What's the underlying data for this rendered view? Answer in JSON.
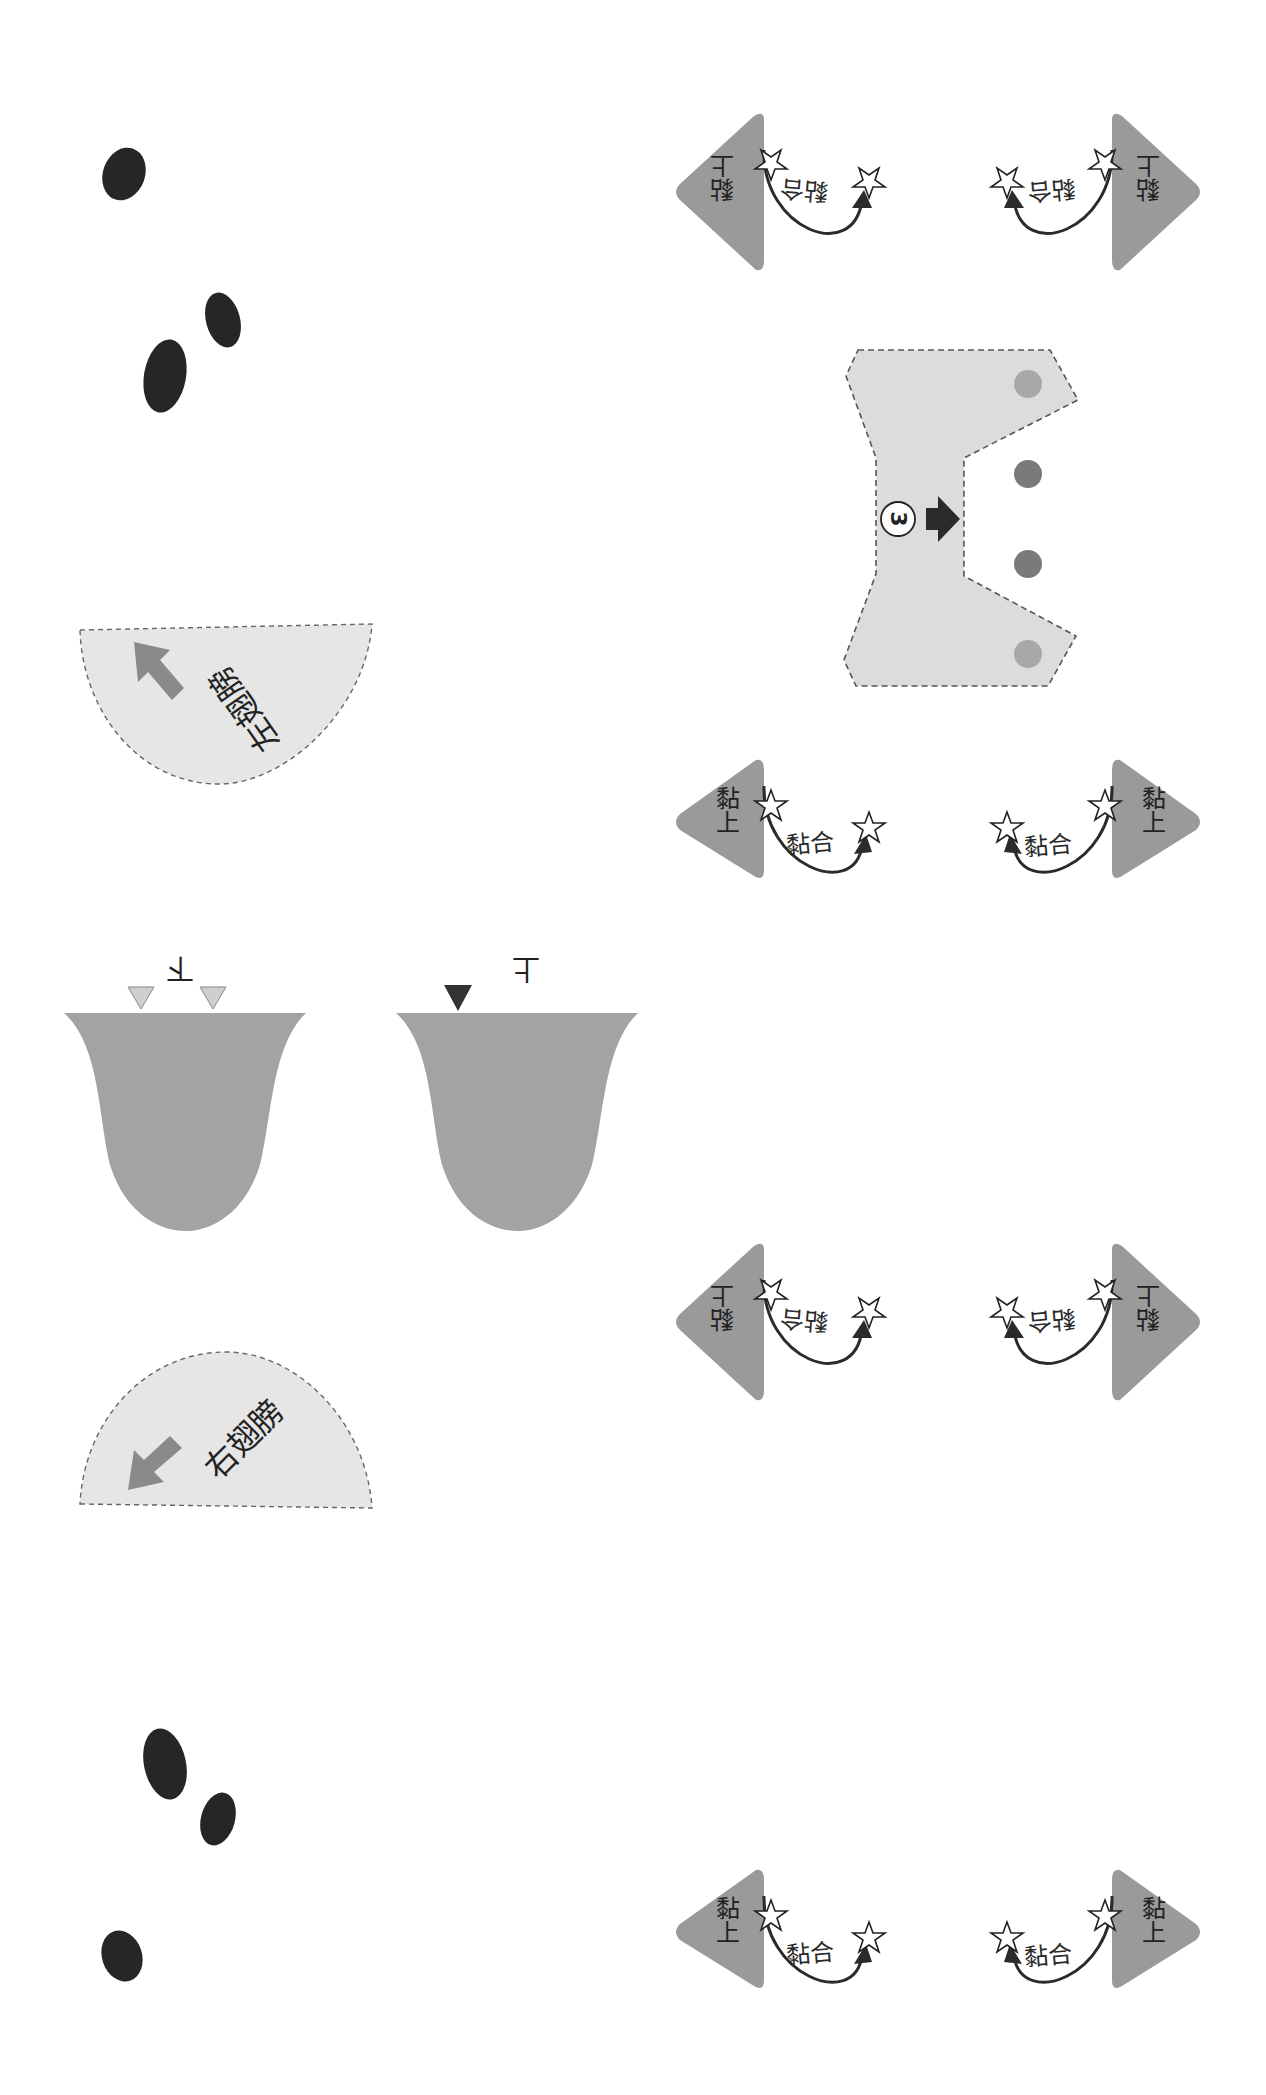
{
  "colors": {
    "tab_gray": "#9a9a9a",
    "panel_fill": "#dcdcdc",
    "wing_fill": "#e6e6e6",
    "tongue_fill": "#a3a3a3",
    "blob": "#262626",
    "arrow_dark": "#2b2b2b",
    "dot_light": "#a8a8a8",
    "dot_dark": "#7a7a7a",
    "wing_arrow": "#8a8a8a",
    "marker_light": "#cfcfcf",
    "marker_dark": "#333333"
  },
  "glue_groups": [
    {
      "id": "top",
      "flipped": true,
      "left": {
        "tab_label": "黏上",
        "arc_label": "黏合"
      },
      "right": {
        "tab_label": "黏上",
        "arc_label": "黏合"
      }
    },
    {
      "id": "upper-middle",
      "flipped": false,
      "left": {
        "tab_label": "黏上",
        "arc_label": "黏合"
      },
      "right": {
        "tab_label": "黏上",
        "arc_label": "黏合"
      }
    },
    {
      "id": "lower-middle",
      "flipped": true,
      "left": {
        "tab_label": "黏上",
        "arc_label": "黏合"
      },
      "right": {
        "tab_label": "黏上",
        "arc_label": "黏合"
      }
    },
    {
      "id": "bottom",
      "flipped": false,
      "left": {
        "tab_label": "黏上",
        "arc_label": "黏合"
      },
      "right": {
        "tab_label": "黏上",
        "arc_label": "黏合"
      }
    }
  ],
  "center_panel": {
    "step_number": "3",
    "dots": 4
  },
  "wings": {
    "left": {
      "label": "左翅膀"
    },
    "right": {
      "label": "右翅膀"
    }
  },
  "tongues": {
    "left": {
      "label": "下",
      "markers": 2
    },
    "right": {
      "label": "上",
      "markers": 1
    }
  },
  "blobs": {
    "top_count": 3,
    "bottom_count": 3
  }
}
